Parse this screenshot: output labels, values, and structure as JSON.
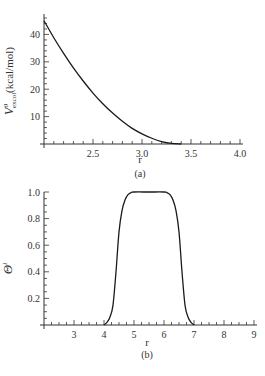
{
  "chart_data": [
    {
      "type": "line",
      "panel": "(a)",
      "title": "",
      "xlabel": "r",
      "ylabel": "V^0_excol(kcal/mol)",
      "ylabel_main": "V",
      "ylabel_sup": "0",
      "ylabel_sub": "excol",
      "ylabel_unit": "(kcal/mol)",
      "xlim": [
        2.0,
        4.0
      ],
      "ylim": [
        0,
        46
      ],
      "xticks": [
        2.5,
        3.0,
        3.5,
        4.0
      ],
      "xtick_labels": [
        "2.5",
        "3.0",
        "3.5",
        "4.0"
      ],
      "x_minor_step": 0.1,
      "yticks": [
        10,
        20,
        30,
        40
      ],
      "ytick_labels": [
        "10",
        "20",
        "30",
        "40"
      ],
      "y_minor_step": 2,
      "grid": false,
      "series": [
        {
          "name": "V0_excol",
          "x": [
            2.0,
            2.1,
            2.2,
            2.3,
            2.4,
            2.5,
            2.6,
            2.7,
            2.8,
            2.9,
            3.0,
            3.1,
            3.2,
            3.3,
            3.4
          ],
          "y": [
            45.0,
            38.8,
            33.1,
            27.8,
            23.0,
            18.6,
            14.7,
            11.3,
            8.3,
            5.7,
            3.7,
            2.1,
            0.9,
            0.2,
            0.0
          ]
        }
      ],
      "caption": "(a)"
    },
    {
      "type": "line",
      "panel": "(b)",
      "title": "",
      "xlabel": "r",
      "ylabel": "Θ^l",
      "ylabel_main": "Θ",
      "ylabel_sup": "l",
      "xlim": [
        2,
        9
      ],
      "ylim": [
        0,
        1.0
      ],
      "xticks": [
        3,
        4,
        5,
        6,
        7,
        8,
        9
      ],
      "xtick_labels": [
        "3",
        "4",
        "5",
        "6",
        "7",
        "8",
        "9"
      ],
      "x_minor_step": 0.25,
      "yticks": [
        0.2,
        0.4,
        0.6,
        0.8,
        1.0
      ],
      "ytick_labels": [
        "0.2",
        "0.4",
        "0.6",
        "0.8",
        "1.0"
      ],
      "y_minor_step": 0.05,
      "grid": false,
      "series": [
        {
          "name": "Theta_l",
          "x": [
            4.0,
            4.1,
            4.2,
            4.3,
            4.4,
            4.5,
            4.6,
            4.7,
            4.8,
            4.9,
            5.0,
            5.5,
            6.0,
            6.1,
            6.2,
            6.3,
            6.4,
            6.5,
            6.6,
            6.7,
            6.8,
            6.9,
            7.0
          ],
          "y": [
            0.0,
            0.02,
            0.06,
            0.15,
            0.4,
            0.7,
            0.86,
            0.94,
            0.98,
            0.995,
            1.0,
            1.0,
            1.0,
            0.995,
            0.98,
            0.94,
            0.86,
            0.7,
            0.4,
            0.15,
            0.06,
            0.02,
            0.0
          ]
        }
      ],
      "caption": "(b)"
    }
  ],
  "panels": [
    {
      "plot": {
        "left": 44,
        "right": 240,
        "top": 18,
        "bottom": 144
      },
      "label_y": 163,
      "caption_y": 177
    },
    {
      "plot": {
        "left": 44,
        "right": 254,
        "top": 192,
        "bottom": 325
      },
      "label_y": 346,
      "caption_y": 358
    }
  ],
  "colors": {
    "line": "#1a1a1a",
    "axis": "#333333",
    "text": "#333333"
  }
}
